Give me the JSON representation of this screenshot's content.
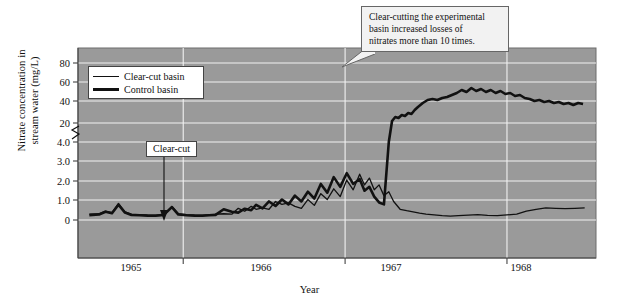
{
  "chart_data": {
    "type": "line",
    "title": "",
    "xlabel": "Year",
    "ylabel_line1": "Nitrate concentration in",
    "ylabel_line2": "stream water (mg/L)",
    "x_tick_labels": [
      "1965",
      "1966",
      "1967",
      "1968"
    ],
    "y_tick_labels": [
      "0",
      "1.0",
      "2.0",
      "3.0",
      "4.0",
      "20",
      "40",
      "60",
      "80"
    ],
    "y_axis_broken": true,
    "y_break_between": [
      4.0,
      20
    ],
    "ylim_lower_segment": [
      0,
      4.0
    ],
    "ylim_upper_segment": [
      10,
      90
    ],
    "grid": true,
    "grid_color": "#f0f0f0",
    "plot_background": "#9a9a9a",
    "legend_position": "upper-left-inside",
    "series": [
      {
        "name": "Clear-cut basin",
        "line_width": "thin",
        "color": "#111111",
        "points": [
          [
            1964.92,
            0.3
          ],
          [
            1964.98,
            0.32
          ],
          [
            1965.02,
            0.45
          ],
          [
            1965.06,
            0.38
          ],
          [
            1965.1,
            0.85
          ],
          [
            1965.14,
            0.42
          ],
          [
            1965.18,
            0.3
          ],
          [
            1965.23,
            0.28
          ],
          [
            1965.28,
            0.26
          ],
          [
            1965.33,
            0.25
          ],
          [
            1965.38,
            0.3
          ],
          [
            1965.43,
            0.7
          ],
          [
            1965.47,
            0.32
          ],
          [
            1965.52,
            0.28
          ],
          [
            1965.57,
            0.26
          ],
          [
            1965.62,
            0.25
          ],
          [
            1965.66,
            0.27
          ],
          [
            1965.7,
            0.3
          ],
          [
            1965.75,
            0.32
          ],
          [
            1965.8,
            0.3
          ],
          [
            1965.84,
            0.6
          ],
          [
            1965.88,
            0.45
          ],
          [
            1965.92,
            0.7
          ],
          [
            1965.95,
            0.55
          ],
          [
            1965.99,
            0.62
          ],
          [
            1966.03,
            0.55
          ],
          [
            1966.07,
            0.95
          ],
          [
            1966.11,
            0.8
          ],
          [
            1966.15,
            0.88
          ],
          [
            1966.19,
            0.7
          ],
          [
            1966.23,
            0.6
          ],
          [
            1966.27,
            1.05
          ],
          [
            1966.31,
            0.75
          ],
          [
            1966.35,
            1.35
          ],
          [
            1966.39,
            1.05
          ],
          [
            1966.43,
            1.6
          ],
          [
            1966.47,
            1.2
          ],
          [
            1966.51,
            2.05
          ],
          [
            1966.55,
            1.55
          ],
          [
            1966.59,
            2.35
          ],
          [
            1966.62,
            1.8
          ],
          [
            1966.65,
            2.15
          ],
          [
            1966.68,
            1.55
          ],
          [
            1966.71,
            1.8
          ],
          [
            1966.74,
            1.25
          ],
          [
            1966.77,
            1.45
          ],
          [
            1966.8,
            0.95
          ],
          [
            1966.84,
            0.55
          ],
          [
            1966.88,
            0.48
          ],
          [
            1966.92,
            0.42
          ],
          [
            1966.96,
            0.35
          ],
          [
            1967.0,
            0.3
          ],
          [
            1967.05,
            0.26
          ],
          [
            1967.1,
            0.22
          ],
          [
            1967.15,
            0.2
          ],
          [
            1967.2,
            0.22
          ],
          [
            1967.26,
            0.25
          ],
          [
            1967.32,
            0.28
          ],
          [
            1967.38,
            0.24
          ],
          [
            1967.44,
            0.22
          ],
          [
            1967.5,
            0.26
          ],
          [
            1967.56,
            0.3
          ],
          [
            1967.62,
            0.45
          ],
          [
            1967.68,
            0.55
          ],
          [
            1967.74,
            0.62
          ],
          [
            1967.8,
            0.6
          ],
          [
            1967.86,
            0.58
          ],
          [
            1967.92,
            0.6
          ],
          [
            1967.98,
            0.62
          ]
        ]
      },
      {
        "name": "Control basin",
        "line_width": "thick",
        "color": "#111111",
        "points": [
          [
            1964.92,
            0.25
          ],
          [
            1964.98,
            0.28
          ],
          [
            1965.02,
            0.42
          ],
          [
            1965.06,
            0.35
          ],
          [
            1965.1,
            0.78
          ],
          [
            1965.14,
            0.38
          ],
          [
            1965.18,
            0.26
          ],
          [
            1965.23,
            0.24
          ],
          [
            1965.28,
            0.22
          ],
          [
            1965.33,
            0.22
          ],
          [
            1965.38,
            0.26
          ],
          [
            1965.43,
            0.66
          ],
          [
            1965.47,
            0.28
          ],
          [
            1965.52,
            0.24
          ],
          [
            1965.57,
            0.22
          ],
          [
            1965.62,
            0.22
          ],
          [
            1965.66,
            0.24
          ],
          [
            1965.7,
            0.26
          ],
          [
            1965.75,
            0.55
          ],
          [
            1965.8,
            0.42
          ],
          [
            1965.84,
            0.38
          ],
          [
            1965.88,
            0.58
          ],
          [
            1965.92,
            0.5
          ],
          [
            1965.95,
            0.78
          ],
          [
            1965.99,
            0.6
          ],
          [
            1966.03,
            0.95
          ],
          [
            1966.07,
            0.72
          ],
          [
            1966.11,
            1.05
          ],
          [
            1966.15,
            0.8
          ],
          [
            1966.19,
            1.25
          ],
          [
            1966.23,
            0.95
          ],
          [
            1966.27,
            1.45
          ],
          [
            1966.31,
            1.1
          ],
          [
            1966.35,
            1.85
          ],
          [
            1966.39,
            1.4
          ],
          [
            1966.43,
            2.2
          ],
          [
            1966.47,
            1.7
          ],
          [
            1966.51,
            2.4
          ],
          [
            1966.55,
            1.85
          ],
          [
            1966.59,
            2.1
          ],
          [
            1966.62,
            1.5
          ],
          [
            1966.65,
            1.7
          ],
          [
            1966.68,
            1.2
          ],
          [
            1966.71,
            0.9
          ],
          [
            1966.74,
            0.8
          ],
          [
            1966.77,
            4.0
          ],
          [
            1966.79,
            22
          ],
          [
            1966.81,
            26
          ],
          [
            1966.83,
            25
          ],
          [
            1966.85,
            28
          ],
          [
            1966.87,
            27
          ],
          [
            1966.89,
            30
          ],
          [
            1966.91,
            29
          ],
          [
            1966.93,
            33
          ],
          [
            1966.95,
            36
          ],
          [
            1966.98,
            40
          ],
          [
            1967.01,
            43
          ],
          [
            1967.04,
            44
          ],
          [
            1967.07,
            43
          ],
          [
            1967.1,
            45
          ],
          [
            1967.13,
            46
          ],
          [
            1967.16,
            48
          ],
          [
            1967.19,
            50
          ],
          [
            1967.22,
            53
          ],
          [
            1967.25,
            51
          ],
          [
            1967.28,
            55
          ],
          [
            1967.31,
            52
          ],
          [
            1967.34,
            54
          ],
          [
            1967.37,
            51
          ],
          [
            1967.4,
            53
          ],
          [
            1967.43,
            50
          ],
          [
            1967.46,
            52
          ],
          [
            1967.49,
            49
          ],
          [
            1967.52,
            50
          ],
          [
            1967.55,
            47
          ],
          [
            1967.58,
            48
          ],
          [
            1967.61,
            45
          ],
          [
            1967.64,
            44
          ],
          [
            1967.67,
            42
          ],
          [
            1967.7,
            43
          ],
          [
            1967.73,
            41
          ],
          [
            1967.76,
            42
          ],
          [
            1967.79,
            40
          ],
          [
            1967.82,
            41
          ],
          [
            1967.85,
            39
          ],
          [
            1967.88,
            40
          ],
          [
            1967.91,
            38
          ],
          [
            1967.94,
            40
          ],
          [
            1967.97,
            39
          ]
        ]
      }
    ],
    "annotations": [
      {
        "name": "clear-cut-marker",
        "text": "Clear-cut",
        "arrow": "down",
        "x_value": 1965.75
      },
      {
        "name": "callout",
        "text_line1": "Clear-cutting the experimental",
        "text_line2": "basin increased losses of",
        "text_line3": "nitrates more than 10 times."
      }
    ]
  },
  "legend": {
    "items": [
      {
        "label": "Clear-cut basin",
        "weight": "thin"
      },
      {
        "label": "Control basin",
        "weight": "thick"
      }
    ]
  },
  "axes": {
    "ylabel_line1": "Nitrate concentration in",
    "ylabel_line2": "stream water (mg/L)",
    "xlabel": "Year",
    "yticks": [
      {
        "label": "80",
        "py": 63
      },
      {
        "label": "60",
        "py": 82
      },
      {
        "label": "40",
        "py": 101
      },
      {
        "label": "20",
        "py": 123
      },
      {
        "label": "4.0",
        "py": 142
      },
      {
        "label": "3.0",
        "py": 161
      },
      {
        "label": "2.0",
        "py": 181
      },
      {
        "label": "1.0",
        "py": 200
      },
      {
        "label": "0",
        "py": 220
      }
    ],
    "xticks": [
      {
        "label": "1965",
        "px": 131
      },
      {
        "label": "1966",
        "px": 261
      },
      {
        "label": "1967",
        "px": 391
      },
      {
        "label": "1968",
        "px": 521
      }
    ]
  },
  "callout": {
    "line1": "Clear-cutting the experimental",
    "line2": "basin increased losses of",
    "line3": "nitrates more than 10 times."
  },
  "clearcut": {
    "label": "Clear-cut"
  }
}
